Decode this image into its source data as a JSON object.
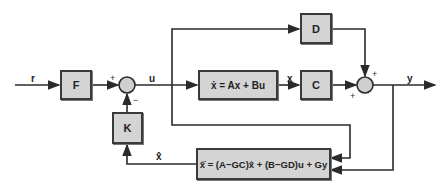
{
  "blocks": {
    "F": "F",
    "plant": "ẋ = Ax + Bu",
    "C": "C",
    "D": "D",
    "K": "K",
    "estimator": "x̂̇ = (A−GC)x̂ + (B−GD)u + Gy"
  },
  "signals": {
    "r": "r",
    "u": "u",
    "x": "x",
    "y": "y",
    "xhat": "x̂"
  },
  "signs": {
    "sum1_plus": "+",
    "sum1_minus": "−",
    "sum2_top_plus": "+",
    "sum2_left_plus": "+"
  },
  "colors": {
    "block_fill": "#d4d4d4",
    "line": "#2a2a2a",
    "junction_fill": "#cfcfcf"
  }
}
